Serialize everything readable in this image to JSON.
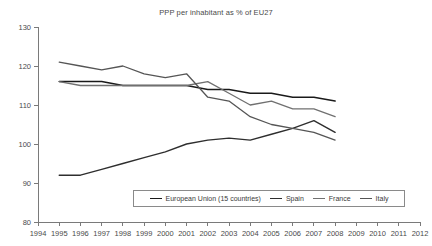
{
  "chart_data": {
    "type": "line",
    "title": "PPP per inhabitant as % of EU27",
    "xlabel": "",
    "ylabel": "",
    "xlim": [
      1994,
      2012
    ],
    "ylim": [
      80,
      130
    ],
    "ytick_step": 10,
    "grid": false,
    "legend_position": "bottom-center",
    "x": [
      1995,
      1996,
      1997,
      1998,
      1999,
      2000,
      2001,
      2002,
      2003,
      2004,
      2005,
      2006,
      2007,
      2008
    ],
    "xtick_labels": [
      "1994",
      "1995",
      "1996",
      "1997",
      "1998",
      "1999",
      "2000",
      "2001",
      "2002",
      "2003",
      "2004",
      "2005",
      "2006",
      "2007",
      "2008",
      "2009",
      "2010",
      "2011",
      "2012"
    ],
    "ytick_labels": [
      "80",
      "90",
      "100",
      "110",
      "120",
      "130"
    ],
    "series": [
      {
        "name": "European Union (15 countries)",
        "color": "#1a1a1a",
        "width": 1.5,
        "values": [
          116,
          116,
          116,
          115,
          115,
          115,
          115,
          114,
          114,
          113,
          113,
          112,
          112,
          111
        ]
      },
      {
        "name": "Spain",
        "color": "#2e2e2e",
        "width": 1.4,
        "values": [
          92,
          92,
          93.5,
          95,
          96.5,
          98,
          100,
          101,
          101.5,
          101,
          102.5,
          104,
          106,
          103
        ]
      },
      {
        "name": "France",
        "color": "#707070",
        "width": 1.3,
        "values": [
          116,
          115,
          115,
          115,
          115,
          115,
          115,
          116,
          113,
          110,
          111,
          109,
          109,
          107
        ]
      },
      {
        "name": "Italy",
        "color": "#555555",
        "width": 1.3,
        "values": [
          121,
          120,
          119,
          120,
          118,
          117,
          118,
          112,
          111,
          107,
          105,
          104,
          103,
          101
        ]
      }
    ]
  },
  "legend": {
    "items": [
      {
        "label": "European Union (15 countries)",
        "color": "#1a1a1a"
      },
      {
        "label": "Spain",
        "color": "#2e2e2e"
      },
      {
        "label": "France",
        "color": "#707070"
      },
      {
        "label": "Italy",
        "color": "#555555"
      }
    ]
  }
}
